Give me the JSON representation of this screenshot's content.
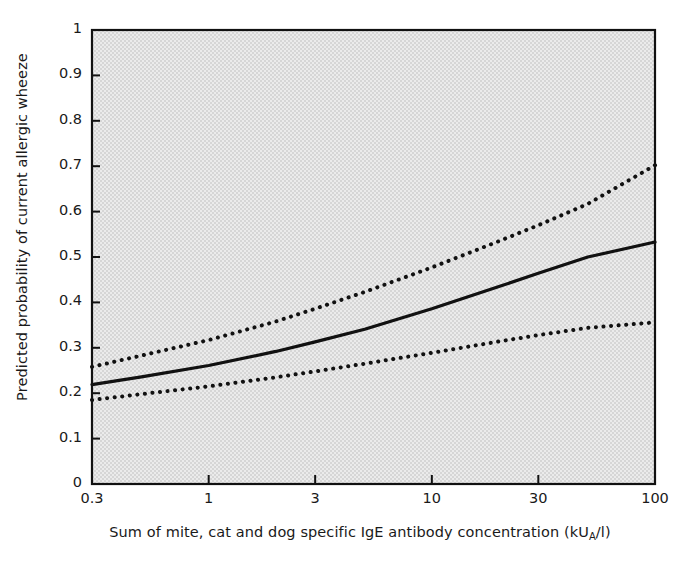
{
  "chart_data": {
    "type": "line",
    "title": "",
    "xlabel": "Sum of mite, cat and dog specific IgE antibody concentration (kU",
    "xlabel_sub": "A",
    "xlabel_tail": "/l)",
    "xlabel_full": "Sum of mite, cat and dog specific IgE antibody concentration (kUA/l)",
    "ylabel": "Predicted probability of current allergic wheeze",
    "xscale": "log",
    "xlim": [
      0.3,
      100
    ],
    "ylim": [
      0,
      1
    ],
    "grid": false,
    "legend": "none",
    "xticks": [
      0.3,
      1,
      3,
      10,
      30,
      100
    ],
    "xtick_labels": [
      "0.3",
      "1",
      "3",
      "10",
      "30",
      "100"
    ],
    "yticks": [
      0,
      0.1,
      0.2,
      0.3,
      0.4,
      0.5,
      0.6,
      0.7,
      0.8,
      0.9,
      1
    ],
    "ytick_labels": [
      "0",
      "0.1",
      "0.2",
      "0.3",
      "0.4",
      "0.5",
      "0.6",
      "0.7",
      "0.8",
      "0.9",
      "1"
    ],
    "x": [
      0.3,
      0.5,
      1,
      2,
      3,
      5,
      10,
      20,
      30,
      50,
      100
    ],
    "series": [
      {
        "name": "Upper 95% confidence limit",
        "style": "dotted",
        "color": "#111111",
        "values": [
          0.258,
          0.283,
          0.317,
          0.358,
          0.386,
          0.423,
          0.477,
          0.535,
          0.57,
          0.617,
          0.702
        ]
      },
      {
        "name": "Predicted probability",
        "style": "solid",
        "color": "#111111",
        "values": [
          0.219,
          0.236,
          0.261,
          0.292,
          0.313,
          0.341,
          0.386,
          0.435,
          0.464,
          0.5,
          0.533
        ]
      },
      {
        "name": "Lower 95% confidence limit",
        "style": "dotted",
        "color": "#111111",
        "values": [
          0.185,
          0.198,
          0.215,
          0.235,
          0.248,
          0.265,
          0.289,
          0.314,
          0.328,
          0.344,
          0.356
        ]
      }
    ],
    "plot_background": "#e2e2e2",
    "axis_color": "#111111"
  }
}
